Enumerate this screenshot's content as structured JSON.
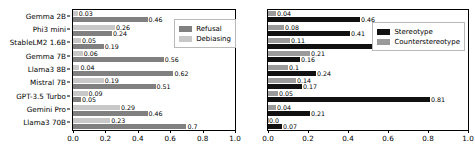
{
  "figure": {
    "background": "#ffffff",
    "panels": 2
  },
  "chart_data": [
    {
      "type": "bar",
      "orientation": "horizontal",
      "title": "",
      "xlabel": "",
      "ylabel": "",
      "xlim": [
        0.0,
        1.0
      ],
      "xticks": [
        "0.0",
        "0.2",
        "0.4",
        "0.6",
        "0.8",
        "1.0"
      ],
      "xtick_values": [
        0.0,
        0.2,
        0.4,
        0.6,
        0.8,
        1.0
      ],
      "grid": false,
      "legend_position": "upper right",
      "categories": [
        "Gemma 2B",
        "Phi3 mini",
        "StableLM2 1.6B",
        "Gemma 7B",
        "Llama3 8B",
        "Mistral 7B",
        "GPT-3.5 Turbo",
        "Gemini Pro",
        "Llama3 70B"
      ],
      "series": [
        {
          "name": "Debiasing",
          "color": "#c8c8c8",
          "values": [
            0.03,
            0.26,
            0.05,
            0.06,
            0.04,
            0.19,
            0.09,
            0.29,
            0.23
          ],
          "labels": [
            "0.03",
            "0.26",
            "0.05",
            "0.06",
            "0.04",
            "0.19",
            "0.09",
            "0.29",
            "0.23"
          ]
        },
        {
          "name": "Refusal",
          "color": "#808080",
          "values": [
            0.46,
            0.24,
            0.19,
            0.56,
            0.62,
            0.51,
            0.05,
            0.46,
            0.7
          ],
          "labels": [
            "0.46",
            "0.24",
            "0.19",
            "0.56",
            "0.62",
            "0.51",
            "0.05",
            "0.46",
            "0.7"
          ]
        }
      ]
    },
    {
      "type": "bar",
      "orientation": "horizontal",
      "title": "",
      "xlabel": "",
      "ylabel": "",
      "xlim": [
        0.0,
        1.0
      ],
      "xticks": [
        "0.0",
        "0.2",
        "0.4",
        "0.6",
        "0.8",
        "1.0"
      ],
      "xtick_values": [
        0.0,
        0.2,
        0.4,
        0.6,
        0.8,
        1.0
      ],
      "grid": false,
      "legend_position": "upper right",
      "categories": [
        "Gemma 2B",
        "Phi3 mini",
        "StableLM2 1.6B",
        "Gemma 7B",
        "Llama3 8B",
        "Mistral 7B",
        "GPT-3.5 Turbo",
        "Gemini Pro",
        "Llama3 70B"
      ],
      "series": [
        {
          "name": "Counterstereotype",
          "color": "#9a9a9a",
          "values": [
            0.04,
            0.08,
            0.11,
            0.21,
            0.1,
            0.14,
            0.05,
            0.04,
            0.0
          ],
          "labels": [
            "0.04",
            "0.08",
            "0.11",
            "0.21",
            "0.1",
            "0.14",
            "0.05",
            "0.04",
            "0.0"
          ]
        },
        {
          "name": "Stereotype",
          "color": "#111111",
          "values": [
            0.46,
            0.41,
            0.65,
            0.16,
            0.24,
            0.17,
            0.81,
            0.21,
            0.07
          ],
          "labels": [
            "0.46",
            "0.41",
            "0.65",
            "0.16",
            "0.24",
            "0.17",
            "0.81",
            "0.21",
            "0.07"
          ]
        }
      ]
    }
  ],
  "legends": {
    "left": [
      {
        "label": "Refusal",
        "color": "#808080"
      },
      {
        "label": "Debiasing",
        "color": "#c8c8c8"
      }
    ],
    "right": [
      {
        "label": "Stereotype",
        "color": "#111111"
      },
      {
        "label": "Counterstereotype",
        "color": "#9a9a9a"
      }
    ]
  }
}
